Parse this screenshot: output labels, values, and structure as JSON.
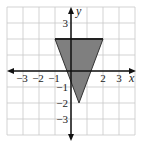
{
  "chart_data": {
    "type": "area",
    "title": "",
    "xlabel": "x",
    "ylabel": "y",
    "xlim": [
      -4,
      4
    ],
    "ylim": [
      -4,
      4
    ],
    "grid": true,
    "grid_step": 1,
    "x_tick_labels": [
      "-3",
      "-2",
      "-1",
      "2",
      "3"
    ],
    "x_ticks": [
      -3,
      -2,
      -1,
      2,
      3
    ],
    "y_tick_labels": [
      "3",
      "-1",
      "-2",
      "-3"
    ],
    "y_ticks": [
      3,
      -1,
      -2,
      -3
    ],
    "series": [
      {
        "name": "shaded triangle",
        "shape": "polygon",
        "vertices": [
          [
            -1,
            2
          ],
          [
            2,
            2
          ],
          [
            0.5,
            -2
          ]
        ],
        "fill": "#7f7f7f",
        "top_edge_bold": true
      }
    ],
    "colors": {
      "grid": "#c8c8c8",
      "axis": "#111111",
      "fill": "#7f7f7f",
      "edge": "#333333"
    }
  }
}
